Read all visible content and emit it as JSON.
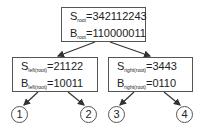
{
  "diagram": {
    "root": {
      "s_label": "S",
      "s_sub": "root",
      "s_value": "=342112243",
      "b_label": "B",
      "b_sub": "root",
      "b_value": "=110000011"
    },
    "left": {
      "s_label": "S",
      "s_sub": "left(root)",
      "s_value": "=21122",
      "b_label": "B",
      "b_sub": "left(root)",
      "b_value": "=10011"
    },
    "right": {
      "s_label": "S",
      "s_sub": "right(root)",
      "s_value": "=3443",
      "b_label": "B",
      "b_sub": "right(root)",
      "b_value": "=0110"
    },
    "leaves": [
      "1",
      "2",
      "3",
      "4"
    ],
    "colors": {
      "stroke": "#555555",
      "text": "#222222"
    }
  }
}
